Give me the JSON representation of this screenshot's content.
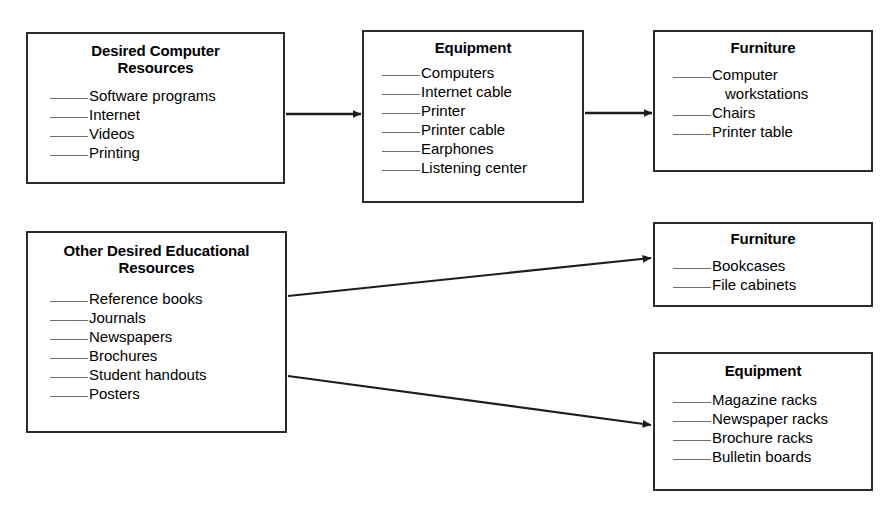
{
  "diagram": {
    "line_color": "#2b2b2b",
    "blank_color": "#6d6d6d",
    "background": "#ffffff",
    "boxes": [
      {
        "id": "desired-computer-resources",
        "title": "Desired Computer\nResources",
        "items": [
          "Software programs",
          "Internet",
          "Videos",
          "Printing"
        ]
      },
      {
        "id": "equipment-top",
        "title": "Equipment",
        "items": [
          "Computers",
          "Internet cable",
          "Printer",
          "Printer cable",
          "Earphones",
          "Listening center"
        ]
      },
      {
        "id": "furniture-top",
        "title": "Furniture",
        "items": [
          "Computer",
          "Chairs",
          "Printer table"
        ],
        "items_wrap": [
          "workstations",
          "",
          ""
        ]
      },
      {
        "id": "other-desired-educational-resources",
        "title": "Other Desired Educational\nResources",
        "items": [
          "Reference books",
          "Journals",
          "Newspapers",
          "Brochures",
          "Student handouts",
          "Posters"
        ]
      },
      {
        "id": "furniture-mid",
        "title": "Furniture",
        "items": [
          "Bookcases",
          "File cabinets"
        ]
      },
      {
        "id": "equipment-bottom",
        "title": "Equipment",
        "items": [
          "Magazine racks",
          "Newspaper racks",
          "Brochure racks",
          "Bulletin boards"
        ]
      }
    ],
    "arrows": [
      {
        "id": "arrow-computer-to-equipment",
        "from": "desired-computer-resources",
        "to": "equipment-top"
      },
      {
        "id": "arrow-equipment-to-furniture",
        "from": "equipment-top",
        "to": "furniture-top"
      },
      {
        "id": "arrow-other-to-furniture",
        "from": "other-desired-educational-resources",
        "to": "furniture-mid"
      },
      {
        "id": "arrow-other-to-equipment",
        "from": "other-desired-educational-resources",
        "to": "equipment-bottom"
      }
    ]
  }
}
